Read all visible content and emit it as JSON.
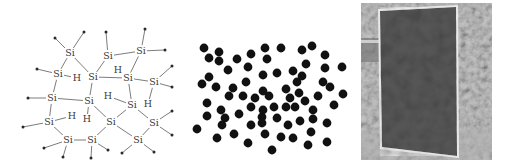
{
  "figure": {
    "panels": [
      {
        "id": "a-si-structure",
        "description": "Amorphous hydrogenated silicon network"
      },
      {
        "id": "random-particles",
        "description": "Random distribution of particles"
      },
      {
        "id": "solar-panel-photo",
        "description": "Photograph of a thin-film solar panel outdoors"
      }
    ]
  },
  "molecule": {
    "si_label": "Si",
    "h_label": "H",
    "si_atoms": [
      {
        "id": 1,
        "x": 70,
        "y": 53
      },
      {
        "id": 2,
        "x": 108,
        "y": 56
      },
      {
        "id": 3,
        "x": 141,
        "y": 51
      },
      {
        "id": 4,
        "x": 58,
        "y": 74
      },
      {
        "id": 5,
        "x": 93,
        "y": 77
      },
      {
        "id": 6,
        "x": 128,
        "y": 78
      },
      {
        "id": 7,
        "x": 154,
        "y": 82
      },
      {
        "id": 8,
        "x": 52,
        "y": 98
      },
      {
        "id": 9,
        "x": 89,
        "y": 101
      },
      {
        "id": 10,
        "x": 132,
        "y": 105
      },
      {
        "id": 11,
        "x": 49,
        "y": 122
      },
      {
        "id": 12,
        "x": 111,
        "y": 122
      },
      {
        "id": 13,
        "x": 154,
        "y": 123
      },
      {
        "id": 14,
        "x": 68,
        "y": 140
      },
      {
        "id": 15,
        "x": 92,
        "y": 140
      },
      {
        "id": 16,
        "x": 138,
        "y": 140
      }
    ],
    "h_atoms": [
      {
        "id": "h1",
        "x": 77,
        "y": 78,
        "bond_to": 4
      },
      {
        "id": "h2",
        "x": 118,
        "y": 70,
        "bond_to": 6
      },
      {
        "id": "h3",
        "x": 148,
        "y": 104,
        "bond_to": 7
      },
      {
        "id": "h4",
        "x": 108,
        "y": 96,
        "bond_to": 10
      },
      {
        "id": "h5",
        "x": 87,
        "y": 119,
        "bond_to": 9
      },
      {
        "id": "h6",
        "x": 72,
        "y": 116,
        "bond_to": 11
      }
    ],
    "si_bonds": [
      [
        1,
        4
      ],
      [
        1,
        5
      ],
      [
        2,
        5
      ],
      [
        2,
        3
      ],
      [
        3,
        6
      ],
      [
        4,
        8
      ],
      [
        5,
        6
      ],
      [
        5,
        9
      ],
      [
        6,
        7
      ],
      [
        6,
        10
      ],
      [
        8,
        9
      ],
      [
        8,
        11
      ],
      [
        9,
        12
      ],
      [
        10,
        12
      ],
      [
        10,
        13
      ],
      [
        11,
        14
      ],
      [
        12,
        16
      ],
      [
        13,
        16
      ],
      [
        14,
        15
      ],
      [
        15,
        12
      ]
    ],
    "terminals": [
      {
        "x": 55,
        "y": 38,
        "bond_to": 1
      },
      {
        "x": 84,
        "y": 32,
        "bond_to": 1
      },
      {
        "x": 106,
        "y": 32,
        "bond_to": 2
      },
      {
        "x": 145,
        "y": 29,
        "bond_to": 3
      },
      {
        "x": 165,
        "y": 50,
        "bond_to": 3
      },
      {
        "x": 37,
        "y": 69,
        "bond_to": 4
      },
      {
        "x": 172,
        "y": 66,
        "bond_to": 7
      },
      {
        "x": 172,
        "y": 87,
        "bond_to": 7
      },
      {
        "x": 28,
        "y": 98,
        "bond_to": 8
      },
      {
        "x": 172,
        "y": 111,
        "bond_to": 13
      },
      {
        "x": 172,
        "y": 135,
        "bond_to": 13
      },
      {
        "x": 23,
        "y": 127,
        "bond_to": 11
      },
      {
        "x": 44,
        "y": 148,
        "bond_to": 14
      },
      {
        "x": 63,
        "y": 157,
        "bond_to": 14
      },
      {
        "x": 91,
        "y": 158,
        "bond_to": 15
      },
      {
        "x": 108,
        "y": 150,
        "bond_to": 15
      },
      {
        "x": 122,
        "y": 153,
        "bond_to": 16
      },
      {
        "x": 154,
        "y": 152,
        "bond_to": 16
      }
    ]
  },
  "particles": {
    "count": 74,
    "points": [
      [
        204,
        48
      ],
      [
        219,
        52
      ],
      [
        209,
        58
      ],
      [
        219,
        61
      ],
      [
        237,
        59
      ],
      [
        251,
        54
      ],
      [
        265,
        48
      ],
      [
        267,
        59
      ],
      [
        281,
        48
      ],
      [
        302,
        50
      ],
      [
        312,
        46
      ],
      [
        325,
        55
      ],
      [
        306,
        64
      ],
      [
        342,
        67
      ],
      [
        325,
        68
      ],
      [
        248,
        67
      ],
      [
        228,
        70
      ],
      [
        263,
        75
      ],
      [
        277,
        73
      ],
      [
        293,
        71
      ],
      [
        302,
        76
      ],
      [
        209,
        77
      ],
      [
        202,
        84
      ],
      [
        216,
        87
      ],
      [
        246,
        82
      ],
      [
        297,
        82
      ],
      [
        323,
        82
      ],
      [
        330,
        87
      ],
      [
        233,
        88
      ],
      [
        229,
        96
      ],
      [
        243,
        96
      ],
      [
        263,
        91
      ],
      [
        269,
        96
      ],
      [
        255,
        98
      ],
      [
        286,
        89
      ],
      [
        290,
        98
      ],
      [
        299,
        93
      ],
      [
        305,
        101
      ],
      [
        318,
        96
      ],
      [
        343,
        94
      ],
      [
        207,
        103
      ],
      [
        221,
        110
      ],
      [
        251,
        107
      ],
      [
        263,
        110
      ],
      [
        274,
        107
      ],
      [
        286,
        107
      ],
      [
        295,
        107
      ],
      [
        313,
        110
      ],
      [
        334,
        105
      ],
      [
        207,
        116
      ],
      [
        225,
        118
      ],
      [
        239,
        114
      ],
      [
        262,
        117
      ],
      [
        277,
        118
      ],
      [
        313,
        119
      ],
      [
        197,
        129
      ],
      [
        222,
        125
      ],
      [
        251,
        125
      ],
      [
        262,
        123
      ],
      [
        288,
        125
      ],
      [
        300,
        121
      ],
      [
        327,
        123
      ],
      [
        217,
        138
      ],
      [
        234,
        134
      ],
      [
        265,
        134
      ],
      [
        281,
        137
      ],
      [
        293,
        138
      ],
      [
        311,
        132
      ],
      [
        248,
        143
      ],
      [
        272,
        150
      ],
      [
        308,
        145
      ],
      [
        327,
        142
      ]
    ]
  },
  "photo": {
    "alt": "Solar panel standing in a garden",
    "colors": {
      "background": "#9a9a9a",
      "panel_fill": "#4d4d4d",
      "panel_frame": "#e8e8e8"
    }
  }
}
